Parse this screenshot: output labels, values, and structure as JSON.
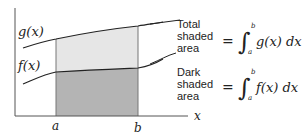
{
  "diagram": {
    "curves": [
      {
        "name": "g(x)",
        "label": "g(x)",
        "role": "upper curve"
      },
      {
        "name": "f(x)",
        "label": "f(x)",
        "role": "lower curve"
      }
    ],
    "axis": {
      "x_label": "x",
      "a_label": "a",
      "b_label": "b"
    },
    "colors": {
      "light_shade": "#e6e6e6",
      "dark_shade": "#b4b4b4",
      "line": "#222222"
    },
    "annotations": [
      {
        "lines": [
          "Total",
          "shaded",
          "area"
        ],
        "equation": {
          "lhs": "=",
          "integrand": "g(x) dx",
          "lower": "a",
          "upper": "b"
        }
      },
      {
        "lines": [
          "Dark",
          "shaded",
          "area"
        ],
        "equation": {
          "lhs": "=",
          "integrand": "f(x) dx",
          "lower": "a",
          "upper": "b"
        }
      }
    ]
  }
}
